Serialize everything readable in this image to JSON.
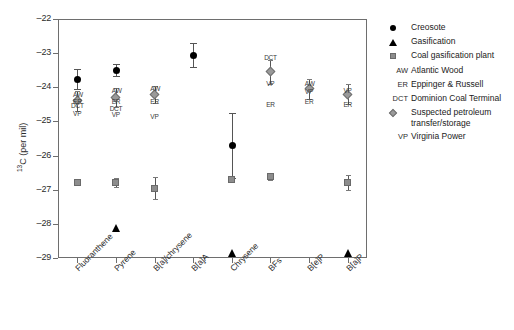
{
  "chart_data": {
    "type": "scatter",
    "title": "",
    "xlabel": "",
    "ylabel": "13C (per mil)",
    "ylabel_sup": "13",
    "ylabel_rest": "C (per mil)",
    "ylim": [
      -29,
      -22
    ],
    "yticks": [
      -22,
      -23,
      -24,
      -25,
      -26,
      -27,
      -28,
      -29
    ],
    "ytick_labels": [
      "–22",
      "–23",
      "–24",
      "–25",
      "–26",
      "–27",
      "–28",
      "–29"
    ],
    "grid": false,
    "legend_position": "right",
    "categories": [
      "Fluoranthene",
      "Pyrene",
      "B[a]/chrysene",
      "B[a]A",
      "Chrysene",
      "BFs",
      "B[e]P",
      "B[a]P"
    ],
    "series": [
      {
        "name": "Creosote",
        "marker": "circle",
        "points": [
          {
            "category": "Fluoranthene",
            "value": -23.75,
            "err_low": 0.3,
            "err_high": 0.3
          },
          {
            "category": "Pyrene",
            "value": -23.5,
            "err_low": 0.18,
            "err_high": 0.18
          },
          {
            "category": "B[a]/chrysene",
            "value": null,
            "err_low": 0,
            "err_high": 0
          },
          {
            "category": "B[a]A",
            "value": -23.05,
            "err_low": 0.35,
            "err_high": 0.35
          },
          {
            "category": "Chrysene",
            "value": -25.7,
            "err_low": 0.95,
            "err_high": 0.95
          },
          {
            "category": "BFs",
            "value": null,
            "err_low": 0,
            "err_high": 0
          },
          {
            "category": "B[e]P",
            "value": null,
            "err_low": 0,
            "err_high": 0
          },
          {
            "category": "B[a]P",
            "value": null,
            "err_low": 0,
            "err_high": 0
          }
        ]
      },
      {
        "name": "Gasification",
        "marker": "triangle",
        "points": [
          {
            "category": "Pyrene",
            "value": -28.2
          },
          {
            "category": "Chrysene",
            "value": -28.95
          },
          {
            "category": "B[a]P",
            "value": -28.95
          }
        ]
      },
      {
        "name": "Coal gasification plant",
        "marker": "square",
        "points": [
          {
            "category": "Fluoranthene",
            "value": -26.78,
            "err_low": 0.05,
            "err_high": 0.05
          },
          {
            "category": "Pyrene",
            "value": -26.8,
            "err_low": 0.13,
            "err_high": 0.13
          },
          {
            "category": "B[a]/chrysene",
            "value": -26.95,
            "err_low": 0.32,
            "err_high": 0.32
          },
          {
            "category": "Chrysene",
            "value": -26.7,
            "err_low": 0.0,
            "err_high": 0.0
          },
          {
            "category": "BFs",
            "value": -26.62,
            "err_low": 0.1,
            "err_high": 0.1
          },
          {
            "category": "B[a]P",
            "value": -26.8,
            "err_low": 0.22,
            "err_high": 0.22
          }
        ]
      },
      {
        "name": "Suspected petroleum transfer/storage",
        "marker": "diamond",
        "points": [
          {
            "category": "Fluoranthene",
            "value": -24.4,
            "err_low": 0.3,
            "err_high": 0.3
          },
          {
            "category": "Pyrene",
            "value": -24.3,
            "err_low": 0.28,
            "err_high": 0.28
          },
          {
            "category": "B[a]/chrysene",
            "value": -24.2,
            "err_low": 0.25,
            "err_high": 0.25
          },
          {
            "category": "BFs",
            "value": -23.55,
            "err_low": 0.35,
            "err_high": 0.35
          },
          {
            "category": "B[e]P",
            "value": -24.05,
            "err_low": 0.3,
            "err_high": 0.3
          },
          {
            "category": "B[a]P",
            "value": -24.2,
            "err_low": 0.3,
            "err_high": 0.3
          }
        ]
      }
    ],
    "text_markers": [
      {
        "label": "AW",
        "category": "Fluoranthene",
        "value": -24.2
      },
      {
        "label": "ER",
        "category": "Fluoranthene",
        "value": -24.42
      },
      {
        "label": "DCT",
        "category": "Fluoranthene",
        "value": -24.52
      },
      {
        "label": "VP",
        "category": "Fluoranthene",
        "value": -24.78
      },
      {
        "label": "AW",
        "category": "Pyrene",
        "value": -24.08
      },
      {
        "label": "ER",
        "category": "Pyrene",
        "value": -24.42
      },
      {
        "label": "DCT",
        "category": "Pyrene",
        "value": -24.62
      },
      {
        "label": "VP",
        "category": "Pyrene",
        "value": -24.8
      },
      {
        "label": "AW",
        "category": "B[a]/chrysene",
        "value": -24.05
      },
      {
        "label": "ER",
        "category": "B[a]/chrysene",
        "value": -24.42
      },
      {
        "label": "VP",
        "category": "B[a]/chrysene",
        "value": -24.85
      },
      {
        "label": "DCT",
        "category": "BFs",
        "value": -23.12
      },
      {
        "label": "VP",
        "category": "BFs",
        "value": -23.9
      },
      {
        "label": "ER",
        "category": "BFs",
        "value": -24.5
      },
      {
        "label": "AW",
        "category": "B[e]P",
        "value": -23.88
      },
      {
        "label": "VP",
        "category": "B[e]P",
        "value": -24.12
      },
      {
        "label": "ER",
        "category": "B[e]P",
        "value": -24.42
      },
      {
        "label": "VP",
        "category": "B[a]P",
        "value": -24.08
      },
      {
        "label": "ER",
        "category": "B[a]P",
        "value": -24.5
      }
    ],
    "legend_entries": [
      {
        "symbol": "circle",
        "symbol_text": "",
        "label": "Creosote"
      },
      {
        "symbol": "triangle",
        "symbol_text": "",
        "label": "Gasification"
      },
      {
        "symbol": "square",
        "symbol_text": "",
        "label": "Coal gasification plant"
      },
      {
        "symbol": "text",
        "symbol_text": "AW",
        "label": "Atlantic Wood"
      },
      {
        "symbol": "text",
        "symbol_text": "ER",
        "label": "Eppinger & Russell"
      },
      {
        "symbol": "text",
        "symbol_text": "DCT",
        "label": "Dominion Coal Terminal"
      },
      {
        "symbol": "diamond",
        "symbol_text": "",
        "label": "Suspected petroleum transfer/storage"
      },
      {
        "symbol": "text",
        "symbol_text": "VP",
        "label": "Virginia Power"
      }
    ],
    "colors": {
      "marker_dark": "#000000",
      "marker_gray": "#8d8d8d",
      "axis": "#6e6e6e",
      "text": "#1a1a1a"
    }
  }
}
